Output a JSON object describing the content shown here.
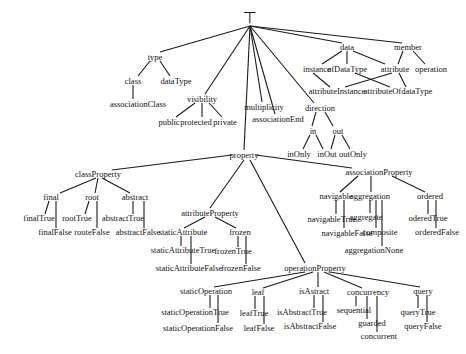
{
  "diagram": {
    "root": {
      "label": "⊤",
      "x": 250,
      "y": 18
    },
    "nodes": {
      "type": {
        "label": "type",
        "x": 155,
        "y": 57
      },
      "class": {
        "label": "class",
        "x": 133,
        "y": 81
      },
      "dataType": {
        "label": "dataType",
        "x": 176,
        "y": 81
      },
      "associationClass": {
        "label": "associationClass",
        "x": 138,
        "y": 104
      },
      "visibility": {
        "label": "visibility",
        "x": 202,
        "y": 99
      },
      "public": {
        "label": "public",
        "x": 169,
        "y": 122
      },
      "protected": {
        "label": "protected",
        "x": 196,
        "y": 122
      },
      "private": {
        "label": "private",
        "x": 225,
        "y": 122
      },
      "multiplicity": {
        "label": "multiplicity",
        "x": 264,
        "y": 107
      },
      "associationEnd": {
        "label": "associationEnd",
        "x": 278,
        "y": 119
      },
      "data": {
        "label": "data",
        "x": 347,
        "y": 47
      },
      "member": {
        "label": "member",
        "x": 408,
        "y": 47
      },
      "instance": {
        "label": "instance",
        "x": 317,
        "y": 69
      },
      "ofDataType": {
        "label": "ofDataType",
        "x": 347,
        "y": 69
      },
      "attribute": {
        "label": "attribute",
        "x": 395,
        "y": 69
      },
      "operation": {
        "label": "operation",
        "x": 431,
        "y": 69
      },
      "attributeInstance": {
        "label": "attributeInstance",
        "x": 337,
        "y": 91
      },
      "attributeOfdataType": {
        "label": "attributeOfdataType",
        "x": 398,
        "y": 91
      },
      "direction": {
        "label": "direction",
        "x": 320,
        "y": 108
      },
      "in": {
        "label": "in",
        "x": 313,
        "y": 131
      },
      "out": {
        "label": "out",
        "x": 338,
        "y": 131
      },
      "inOnly": {
        "label": "inOnly",
        "x": 299,
        "y": 154
      },
      "inOut": {
        "label": "inOut",
        "x": 327,
        "y": 154
      },
      "outOnly": {
        "label": "outOnly",
        "x": 353,
        "y": 154
      },
      "property": {
        "label": "property",
        "x": 244,
        "y": 155
      },
      "associationProperty": {
        "label": "associationProperty",
        "x": 379,
        "y": 172
      },
      "navigable": {
        "label": "navigable",
        "x": 336,
        "y": 196
      },
      "navigableTrue": {
        "label": "navigableTrue",
        "x": 332,
        "y": 219
      },
      "navigableFalse": {
        "label": "navigableFalse",
        "x": 347,
        "y": 233
      },
      "aggregation": {
        "label": "aggregation",
        "x": 370,
        "y": 196
      },
      "aggregate": {
        "label": "aggregate",
        "x": 366,
        "y": 217
      },
      "composite": {
        "label": "composite",
        "x": 380,
        "y": 232
      },
      "aggregationNone": {
        "label": "aggregationNone",
        "x": 374,
        "y": 250
      },
      "ordered": {
        "label": "ordered",
        "x": 430,
        "y": 196
      },
      "orderedTrue": {
        "label": "oderedTrue",
        "x": 428,
        "y": 218
      },
      "orderedFalse": {
        "label": "orderedFalse",
        "x": 437,
        "y": 232
      },
      "classProperty": {
        "label": "classProperty",
        "x": 98,
        "y": 174
      },
      "final": {
        "label": "final",
        "x": 51,
        "y": 197
      },
      "finalTrue": {
        "label": "finalTrue",
        "x": 39,
        "y": 218
      },
      "finalFalse": {
        "label": "finalFalse",
        "x": 55,
        "y": 232
      },
      "root": {
        "label": "root",
        "x": 92,
        "y": 197
      },
      "rootTrue": {
        "label": "rootTrue",
        "x": 77,
        "y": 218
      },
      "routeFalse": {
        "label": "routeFalse",
        "x": 92,
        "y": 232
      },
      "abstract": {
        "label": "abstract",
        "x": 135,
        "y": 197
      },
      "abstractTrue": {
        "label": "abstractTrue",
        "x": 123,
        "y": 218
      },
      "abstractFalse": {
        "label": "abstractFalse",
        "x": 138,
        "y": 232
      },
      "attributeProperty": {
        "label": "attributeProperty",
        "x": 210,
        "y": 213
      },
      "staticAttribute": {
        "label": "staticAttribute",
        "x": 183,
        "y": 232
      },
      "staticAttributeTrue": {
        "label": "staticAttributeTrue",
        "x": 183,
        "y": 250
      },
      "staticAttributeFalse": {
        "label": "staticAttributeFalse",
        "x": 189,
        "y": 268
      },
      "frozen": {
        "label": "frozen",
        "x": 240,
        "y": 232
      },
      "frozenTrue": {
        "label": "frozenTrue",
        "x": 233,
        "y": 251
      },
      "frozenFalse": {
        "label": "frozenFalse",
        "x": 241,
        "y": 268
      },
      "operationProperty": {
        "label": "operationProperty",
        "x": 315,
        "y": 268
      },
      "staticOperation": {
        "label": "staticOperation",
        "x": 206,
        "y": 291
      },
      "staticOperationTrue": {
        "label": "staticOperationTrue",
        "x": 195,
        "y": 312
      },
      "staticOperationFalse": {
        "label": "staticOperationFalse",
        "x": 198,
        "y": 328
      },
      "leaf": {
        "label": "leaf",
        "x": 258,
        "y": 292
      },
      "leafTrue": {
        "label": "leafTrue",
        "x": 254,
        "y": 313
      },
      "leafFalse": {
        "label": "leafFalse",
        "x": 259,
        "y": 328
      },
      "isAstract": {
        "label": "isAstract",
        "x": 314,
        "y": 291
      },
      "isAbstractTrue": {
        "label": "isAbstractTrue",
        "x": 302,
        "y": 312
      },
      "isAbstractFalse": {
        "label": "isAbstractFalse",
        "x": 310,
        "y": 326
      },
      "concurrency": {
        "label": "concurrency",
        "x": 368,
        "y": 292
      },
      "sequential": {
        "label": "sequential",
        "x": 354,
        "y": 310
      },
      "guarded": {
        "label": "guarded",
        "x": 372,
        "y": 323
      },
      "concurrent": {
        "label": "concurrent",
        "x": 379,
        "y": 336
      },
      "query": {
        "label": "query",
        "x": 423,
        "y": 291
      },
      "queryTrue": {
        "label": "queryTrue",
        "x": 418,
        "y": 312
      },
      "queryFalse": {
        "label": "queryFalse",
        "x": 423,
        "y": 326
      }
    },
    "edges": [
      [
        250,
        26,
        160,
        52
      ],
      [
        250,
        26,
        205,
        94
      ],
      [
        250,
        26,
        244,
        150
      ],
      [
        250,
        26,
        262,
        102
      ],
      [
        250,
        26,
        275,
        114
      ],
      [
        250,
        26,
        314,
        103
      ],
      [
        250,
        26,
        342,
        43
      ],
      [
        250,
        26,
        402,
        43
      ],
      [
        150,
        61,
        138,
        76
      ],
      [
        160,
        61,
        170,
        76
      ],
      [
        133,
        85,
        133,
        99
      ],
      [
        195,
        103,
        176,
        117
      ],
      [
        202,
        103,
        202,
        117
      ],
      [
        209,
        103,
        222,
        117
      ],
      [
        342,
        51,
        322,
        64
      ],
      [
        347,
        51,
        347,
        64
      ],
      [
        353,
        51,
        385,
        64
      ],
      [
        403,
        51,
        398,
        64
      ],
      [
        413,
        51,
        425,
        64
      ],
      [
        313,
        73,
        330,
        87
      ],
      [
        355,
        73,
        390,
        87
      ],
      [
        392,
        73,
        345,
        87
      ],
      [
        399,
        73,
        406,
        87
      ],
      [
        316,
        112,
        312,
        126
      ],
      [
        325,
        112,
        333,
        126
      ],
      [
        310,
        135,
        303,
        149
      ],
      [
        316,
        135,
        323,
        149
      ],
      [
        335,
        135,
        331,
        149
      ],
      [
        342,
        135,
        350,
        149
      ],
      [
        232,
        155,
        112,
        170
      ],
      [
        244,
        160,
        210,
        208
      ],
      [
        250,
        160,
        305,
        263
      ],
      [
        256,
        155,
        352,
        168
      ],
      [
        96,
        178,
        60,
        193
      ],
      [
        98,
        178,
        95,
        193
      ],
      [
        102,
        178,
        130,
        193
      ],
      [
        49,
        201,
        45,
        214
      ],
      [
        56,
        201,
        56,
        228
      ],
      [
        89,
        201,
        85,
        214
      ],
      [
        97,
        201,
        97,
        228
      ],
      [
        133,
        201,
        133,
        214
      ],
      [
        144,
        201,
        144,
        228
      ],
      [
        358,
        176,
        340,
        192
      ],
      [
        371,
        176,
        371,
        192
      ],
      [
        392,
        176,
        425,
        192
      ],
      [
        336,
        200,
        336,
        214
      ],
      [
        344,
        200,
        344,
        228
      ],
      [
        370,
        200,
        370,
        213
      ],
      [
        376,
        200,
        376,
        228
      ],
      [
        382,
        200,
        382,
        246
      ],
      [
        428,
        200,
        428,
        214
      ],
      [
        436,
        200,
        436,
        228
      ],
      [
        205,
        217,
        184,
        228
      ],
      [
        215,
        217,
        236,
        228
      ],
      [
        181,
        236,
        181,
        246
      ],
      [
        191,
        236,
        191,
        264
      ],
      [
        238,
        236,
        238,
        247
      ],
      [
        246,
        236,
        246,
        264
      ],
      [
        305,
        272,
        214,
        287
      ],
      [
        313,
        272,
        263,
        288
      ],
      [
        318,
        272,
        318,
        287
      ],
      [
        324,
        272,
        362,
        288
      ],
      [
        330,
        272,
        420,
        287
      ],
      [
        210,
        295,
        210,
        308
      ],
      [
        218,
        295,
        218,
        323
      ],
      [
        255,
        296,
        255,
        309
      ],
      [
        264,
        296,
        264,
        324
      ],
      [
        314,
        295,
        314,
        308
      ],
      [
        323,
        295,
        323,
        322
      ],
      [
        356,
        296,
        356,
        306
      ],
      [
        367,
        296,
        367,
        319
      ],
      [
        377,
        296,
        377,
        332
      ],
      [
        418,
        295,
        418,
        308
      ],
      [
        427,
        295,
        427,
        322
      ]
    ]
  }
}
